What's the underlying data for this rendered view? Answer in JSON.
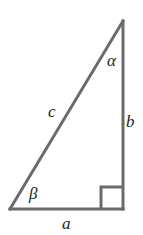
{
  "figure": {
    "background_color": "#ffffff",
    "stroke_color": "#6b6b6b",
    "text_color": "#231f20",
    "stroke_width": 3,
    "width": 143,
    "height": 235
  },
  "geometry": {
    "apex_top": {
      "x": 123,
      "y": 21
    },
    "vertex_bottom_left": {
      "x": 10,
      "y": 209
    },
    "vertex_bottom_right": {
      "x": 123,
      "y": 209
    },
    "right_angle_marker": {
      "x": 101,
      "y": 187,
      "size": 21
    }
  },
  "labels": {
    "angle_alpha": "α",
    "angle_beta": "β",
    "side_a": "a",
    "side_b": "b",
    "side_c": "c"
  },
  "semantics": {
    "side_a_description": "a",
    "side_b_description": "b",
    "side_c_description": "c",
    "right_angle_value": "90"
  }
}
